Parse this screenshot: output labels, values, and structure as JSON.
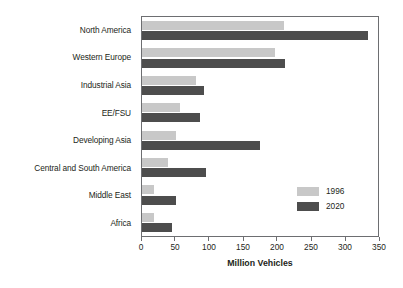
{
  "chart_data": {
    "type": "bar",
    "orientation": "horizontal",
    "title": "",
    "xlabel": "Million Vehicles",
    "ylabel": "",
    "xlim": [
      0,
      350
    ],
    "xticks": [
      0,
      50,
      100,
      150,
      200,
      250,
      300,
      350
    ],
    "xticklabels": [
      "0",
      "50",
      "100",
      "150",
      "200",
      "250",
      "300",
      "350"
    ],
    "grid": false,
    "legend_position": "lower right",
    "categories": [
      "North America",
      "Western Europe",
      "Industrial Asia",
      "EE/FSU",
      "Developing Asia",
      "Central and South America",
      "Middle East",
      "Africa"
    ],
    "series": [
      {
        "name": "1996",
        "color": "#c8c8c8",
        "values": [
          210,
          197,
          80,
          57,
          50,
          38,
          18,
          18
        ]
      },
      {
        "name": "2020",
        "color": "#4d4d4d",
        "values": [
          335,
          212,
          92,
          86,
          175,
          95,
          50,
          45
        ]
      }
    ]
  },
  "legend": {
    "entries": [
      {
        "label": "1996",
        "swatch": "#c8c8c8"
      },
      {
        "label": "2020",
        "swatch": "#4d4d4d"
      }
    ]
  },
  "axis": {
    "x_title": "Million Vehicles"
  }
}
